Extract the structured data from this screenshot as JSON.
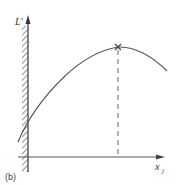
{
  "figure": {
    "panel_label": "(b)",
    "y_axis_label": "L′",
    "x_axis_label_main": "x",
    "x_axis_label_sub": "j",
    "colors": {
      "line": "#555555",
      "hatch": "#666666",
      "background": "#ffffff"
    }
  },
  "diagram": {
    "type": "function-curve",
    "elements": [
      {
        "kind": "axis",
        "name": "vertical-axis",
        "label": "L′",
        "hatched_wall": true
      },
      {
        "kind": "axis",
        "name": "horizontal-axis",
        "label": "x_j"
      },
      {
        "kind": "curve",
        "name": "concave-curve",
        "shape": "rises, peaks, then falls"
      },
      {
        "kind": "marker",
        "name": "maximum-marker",
        "glyph": "×"
      },
      {
        "kind": "dashed-line",
        "name": "maximum-drop-line",
        "from": "maximum",
        "to": "horizontal-axis"
      }
    ]
  }
}
